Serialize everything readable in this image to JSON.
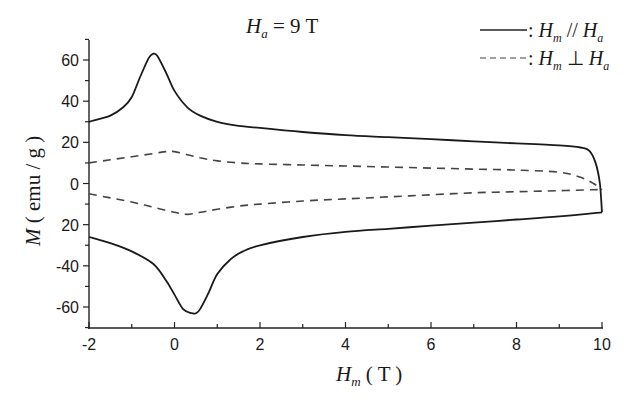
{
  "chart_data": {
    "type": "line",
    "annotation": {
      "symbol": "H",
      "subscript": "a",
      "text": " = 9 T"
    },
    "xlabel": {
      "symbol": "H",
      "subscript": "m",
      "unit": " ( T )"
    },
    "ylabel": {
      "symbol": "M",
      "unit": " ( emu / g )"
    },
    "xlim": [
      -2,
      10
    ],
    "ylim": [
      -70,
      70
    ],
    "xticks": [
      -2,
      0,
      2,
      4,
      6,
      8,
      10
    ],
    "xtick_labels": [
      "-2",
      "0",
      "2",
      "4",
      "6",
      "8",
      "10"
    ],
    "yticks": [
      60,
      40,
      20,
      0,
      -20,
      -40,
      -60
    ],
    "ytick_labels": [
      "60",
      "40",
      "20",
      "0",
      "20",
      "-40",
      "-60"
    ],
    "grid": false,
    "legend": {
      "position": "upper right",
      "entries": [
        {
          "style": "solid",
          "label_parts": [
            "H",
            "m",
            " // ",
            "H",
            "a"
          ],
          "label": "H_m // H_a"
        },
        {
          "style": "dashed",
          "label_parts": [
            "H",
            "m",
            " ⊥ ",
            "H",
            "a"
          ],
          "label": "H_m ⊥ H_a"
        }
      ]
    },
    "series": [
      {
        "name": "H_m // H_a (upper branch)",
        "style": "solid",
        "x": [
          -2,
          -1.5,
          -1.2,
          -1.0,
          -0.8,
          -0.6,
          -0.5,
          -0.4,
          -0.2,
          0,
          0.3,
          0.6,
          1.0,
          1.5,
          2,
          3,
          4,
          5,
          6,
          7,
          8,
          9,
          9.5,
          9.7,
          9.85,
          9.95,
          10
        ],
        "y": [
          30,
          33,
          37,
          42,
          52,
          61,
          63,
          62,
          54,
          45,
          37,
          33,
          30,
          28,
          27,
          25,
          23.5,
          22.5,
          21.5,
          20.5,
          19.5,
          18.5,
          17.5,
          16,
          10,
          0,
          -14
        ]
      },
      {
        "name": "H_m // H_a (lower branch)",
        "style": "solid",
        "x": [
          -2,
          -1.5,
          -1.0,
          -0.5,
          -0.2,
          0,
          0.2,
          0.4,
          0.5,
          0.6,
          0.8,
          1.0,
          1.3,
          1.6,
          2,
          3,
          4,
          5,
          6,
          7,
          8,
          9,
          10
        ],
        "y": [
          -26,
          -29,
          -33,
          -39,
          -47,
          -54,
          -61,
          -63,
          -63,
          -61,
          -53,
          -44,
          -37,
          -33,
          -30,
          -26,
          -23.5,
          -22,
          -20.5,
          -19,
          -17.5,
          -16,
          -14
        ]
      },
      {
        "name": "H_m ⊥ H_a (upper branch)",
        "style": "dashed",
        "x": [
          -2,
          -1.5,
          -1.0,
          -0.5,
          -0.2,
          0,
          0.3,
          0.6,
          1.0,
          1.5,
          2,
          3,
          4,
          5,
          6,
          7,
          8,
          9,
          9.5,
          9.8,
          10
        ],
        "y": [
          10,
          11.5,
          13,
          14.5,
          15.5,
          15.5,
          14,
          12.5,
          11,
          10,
          9.5,
          9,
          8.5,
          8,
          7.5,
          7,
          6.5,
          5.5,
          3,
          0,
          -3
        ]
      },
      {
        "name": "H_m ⊥ H_a (lower branch)",
        "style": "dashed",
        "x": [
          -2,
          -1.5,
          -1.0,
          -0.5,
          0,
          0.3,
          0.6,
          1.0,
          1.5,
          2,
          3,
          4,
          5,
          6,
          7,
          8,
          9,
          9.8,
          10
        ],
        "y": [
          -5,
          -7,
          -9,
          -11.5,
          -14,
          -15,
          -14,
          -12.5,
          -11,
          -10,
          -8.5,
          -7.5,
          -6.5,
          -5.5,
          -4.5,
          -4,
          -3.5,
          -3,
          -3
        ]
      }
    ]
  }
}
